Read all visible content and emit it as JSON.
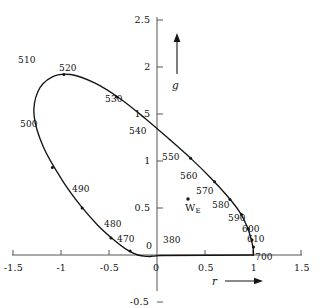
{
  "chart_data": {
    "type": "line",
    "title": "",
    "subtitle": "",
    "xlabel": "r",
    "ylabel": "g",
    "xlim": [
      -1.5,
      1.5
    ],
    "ylim": [
      -0.5,
      2.5
    ],
    "grid": false,
    "legend": null,
    "x_ticks": [
      {
        "value": -1.5,
        "label": "-1.5"
      },
      {
        "value": -1.0,
        "label": "-1"
      },
      {
        "value": -0.5,
        "label": "-0.5"
      },
      {
        "value": 0.0,
        "label": "0"
      },
      {
        "value": 0.5,
        "label": "0.5"
      },
      {
        "value": 1.0,
        "label": "1"
      },
      {
        "value": 1.5,
        "label": "1.5"
      }
    ],
    "y_ticks": [
      {
        "value": 2.5,
        "label": "2.5"
      },
      {
        "value": 2.0,
        "label": "2"
      },
      {
        "value": 1.5,
        "label": "1.5"
      },
      {
        "value": 1.0,
        "label": "1"
      },
      {
        "value": 0.5,
        "label": "0.5"
      },
      {
        "value": 0.0,
        "label": "0"
      },
      {
        "value": -0.5,
        "label": "-0.5"
      }
    ],
    "series": [
      {
        "name": "spectral-locus",
        "type": "line",
        "points": [
          [
            0.03,
            -0.005
          ],
          [
            0.02,
            -0.006
          ],
          [
            0.0,
            -0.008
          ],
          [
            -0.04,
            -0.012
          ],
          [
            -0.1,
            -0.015
          ],
          [
            -0.2,
            0.0
          ],
          [
            -0.32,
            0.06
          ],
          [
            -0.46,
            0.17
          ],
          [
            -0.62,
            0.32
          ],
          [
            -0.8,
            0.53
          ],
          [
            -0.99,
            0.8
          ],
          [
            -1.18,
            1.14
          ],
          [
            -1.28,
            1.48
          ],
          [
            -1.24,
            1.74
          ],
          [
            -1.1,
            1.89
          ],
          [
            -0.9,
            1.92
          ],
          [
            -0.65,
            1.83
          ],
          [
            -0.38,
            1.66
          ],
          [
            -0.12,
            1.45
          ],
          [
            0.13,
            1.23
          ],
          [
            0.36,
            1.02
          ],
          [
            0.56,
            0.82
          ],
          [
            0.73,
            0.63
          ],
          [
            0.86,
            0.46
          ],
          [
            0.94,
            0.3
          ],
          [
            0.98,
            0.17
          ],
          [
            1.0,
            0.08
          ],
          [
            1.005,
            0.03
          ],
          [
            1.005,
            0.0
          ]
        ]
      },
      {
        "name": "purple-line",
        "type": "line",
        "points": [
          [
            1.005,
            0.0
          ],
          [
            0.03,
            -0.005
          ]
        ]
      }
    ],
    "wavelength_markers": [
      {
        "label": "380",
        "x": 0.1,
        "y": -0.012,
        "lx": 163,
        "ly": 236,
        "mx": null,
        "my": null,
        "dot": false
      },
      {
        "label": "470",
        "x": -0.28,
        "y": 0.042,
        "lx": 117,
        "ly": 235,
        "mx": 130,
        "my": 248,
        "dot": true
      },
      {
        "label": "480",
        "x": -0.48,
        "y": 0.18,
        "lx": 104,
        "ly": 220,
        "mx": 139,
        "my": 238,
        "dot": true
      },
      {
        "label": "490",
        "x": -0.78,
        "y": 0.5,
        "lx": 72,
        "ly": 185,
        "mx": 105,
        "my": 205,
        "dot": true
      },
      {
        "label": "500",
        "x": -1.09,
        "y": 0.93,
        "lx": 20,
        "ly": 120,
        "mx": 57,
        "my": 141,
        "dot": true
      },
      {
        "label": "510",
        "x": -1.27,
        "y": 1.75,
        "lx": 18,
        "ly": 56,
        "mx": null,
        "my": null,
        "dot": false
      },
      {
        "label": "520",
        "x": -0.97,
        "y": 1.92,
        "lx": 59,
        "ly": 64,
        "mx": 86,
        "my": 74,
        "dot": true
      },
      {
        "label": "530",
        "x": -0.42,
        "y": 1.68,
        "lx": 105,
        "ly": 95,
        "mx": 136,
        "my": 112,
        "dot": true
      },
      {
        "label": "540",
        "x": 0.05,
        "y": 1.33,
        "lx": 129,
        "ly": 127,
        "mx": 160,
        "my": 133,
        "dot": false
      },
      {
        "label": "550",
        "x": 0.35,
        "y": 1.03,
        "lx": 162,
        "ly": 153,
        "mx": 173,
        "my": 160,
        "dot": true
      },
      {
        "label": "560",
        "x": 0.6,
        "y": 0.78,
        "lx": 180,
        "ly": 172,
        "mx": 192,
        "my": 180,
        "dot": true
      },
      {
        "label": "570",
        "x": 0.76,
        "y": 0.59,
        "lx": 196,
        "ly": 187,
        "mx": 207,
        "my": 196,
        "dot": true
      },
      {
        "label": "580",
        "x": 0.88,
        "y": 0.43,
        "lx": 212,
        "ly": 201,
        "mx": 221,
        "my": 210,
        "dot": true
      },
      {
        "label": "590",
        "x": 0.95,
        "y": 0.28,
        "lx": 228,
        "ly": 214,
        "mx": 234,
        "my": 223,
        "dot": true
      },
      {
        "label": "600",
        "x": 0.99,
        "y": 0.16,
        "lx": 242,
        "ly": 225,
        "mx": 245,
        "my": 233,
        "dot": true
      },
      {
        "label": "610",
        "x": 1.005,
        "y": 0.085,
        "lx": 247,
        "ly": 235,
        "mx": 250,
        "my": 241,
        "dot": true
      },
      {
        "label": "700",
        "x": 1.005,
        "y": 0.0,
        "lx": 255,
        "ly": 253,
        "mx": null,
        "my": null,
        "dot": false
      }
    ],
    "points": [
      {
        "name": "equal-energy-white",
        "label": "W",
        "sublabel": "E",
        "x": 0.333,
        "y": 0.333,
        "px": 188,
        "py": 199
      }
    ],
    "origin_label": "0",
    "annotations": []
  },
  "axes": {
    "x_axis_name": "r",
    "y_axis_name": "g",
    "x_arrow": "arrow-right",
    "y_arrow": "arrow-up"
  },
  "colors": {
    "curve": "#141414",
    "axis": "#555555",
    "text": "#111111",
    "background": "#ffffff"
  }
}
